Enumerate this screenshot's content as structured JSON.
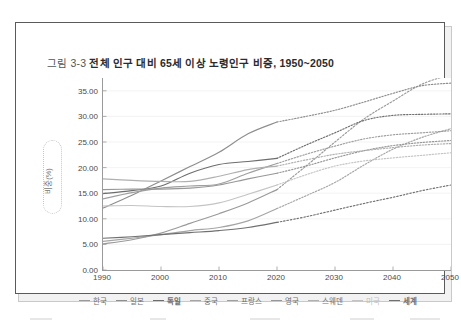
{
  "figure": {
    "number": "그림 3-3",
    "caption": "전체 인구 대비 65세 이상 노령인구 비중, 1950~2050",
    "full_title": "그림 3-3 전체 인구 대비 65세 이상 노령인구 비중, 1950~2050"
  },
  "chart_data": {
    "type": "line",
    "title": "전체 인구 대비 65세 이상 노령인구 비중, 1950~2050",
    "xlabel": "",
    "ylabel": "비중(%)",
    "xlim": [
      1990,
      2050
    ],
    "ylim": [
      0.0,
      37.5
    ],
    "yticks": [
      "0.00",
      "5.00",
      "10.00",
      "15.00",
      "20.00",
      "25.00",
      "30.00",
      "35.00"
    ],
    "ytick_values": [
      0,
      5,
      10,
      15,
      20,
      25,
      30,
      35
    ],
    "xticks": [
      "1990",
      "2000",
      "2010",
      "2020",
      "2030",
      "2040",
      "2050"
    ],
    "xtick_values": [
      1990,
      2000,
      2010,
      2020,
      2030,
      2040,
      2050
    ],
    "grid": "horizontal-faint",
    "legend_position": "bottom",
    "projection_start": 2020,
    "projection_style": "dotted",
    "x": [
      1990,
      1995,
      2000,
      2005,
      2010,
      2015,
      2020,
      2025,
      2030,
      2035,
      2040,
      2045,
      2050
    ],
    "series": [
      {
        "name": "한국",
        "color": "#9a9a9a",
        "values": [
          5.1,
          5.9,
          7.2,
          9.1,
          11.0,
          13.1,
          15.7,
          20.3,
          25.0,
          29.5,
          33.0,
          36.3,
          38.2
        ]
      },
      {
        "name": "일본",
        "color": "#8e8e8e",
        "values": [
          12.1,
          14.6,
          17.4,
          20.2,
          23.0,
          26.6,
          28.9,
          30.0,
          31.2,
          32.8,
          34.5,
          36.0,
          36.5
        ]
      },
      {
        "name": "독일",
        "color": "#6d6d6d",
        "values": [
          14.9,
          15.5,
          16.4,
          18.9,
          20.6,
          21.2,
          21.8,
          24.4,
          26.8,
          29.2,
          30.2,
          30.4,
          30.5
        ]
      },
      {
        "name": "중국",
        "color": "#a5a5a5",
        "values": [
          5.6,
          6.2,
          6.9,
          7.7,
          8.3,
          9.6,
          12.0,
          14.5,
          17.1,
          20.5,
          23.6,
          25.9,
          27.6
        ]
      },
      {
        "name": "프랑스",
        "color": "#9f9f9f",
        "values": [
          13.9,
          15.1,
          16.0,
          16.4,
          16.8,
          18.9,
          20.8,
          22.6,
          24.2,
          25.6,
          26.4,
          26.8,
          27.2
        ]
      },
      {
        "name": "영국",
        "color": "#979797",
        "values": [
          15.7,
          15.8,
          15.8,
          16.0,
          16.6,
          17.8,
          18.9,
          20.3,
          21.9,
          23.3,
          24.3,
          24.9,
          25.3
        ]
      },
      {
        "name": "스웨덴",
        "color": "#b0b0b0",
        "values": [
          17.8,
          17.5,
          17.3,
          17.3,
          18.3,
          19.6,
          20.3,
          21.5,
          22.6,
          23.3,
          23.9,
          24.4,
          24.7
        ]
      },
      {
        "name": "미국",
        "color": "#c4c4c4",
        "values": [
          12.5,
          12.6,
          12.4,
          12.4,
          13.1,
          14.8,
          16.6,
          18.6,
          20.3,
          21.3,
          21.9,
          22.4,
          22.9
        ]
      },
      {
        "name": "세계",
        "color": "#707070",
        "values": [
          6.2,
          6.5,
          6.9,
          7.3,
          7.7,
          8.3,
          9.3,
          10.4,
          11.7,
          13.0,
          14.2,
          15.5,
          16.6
        ]
      }
    ]
  }
}
